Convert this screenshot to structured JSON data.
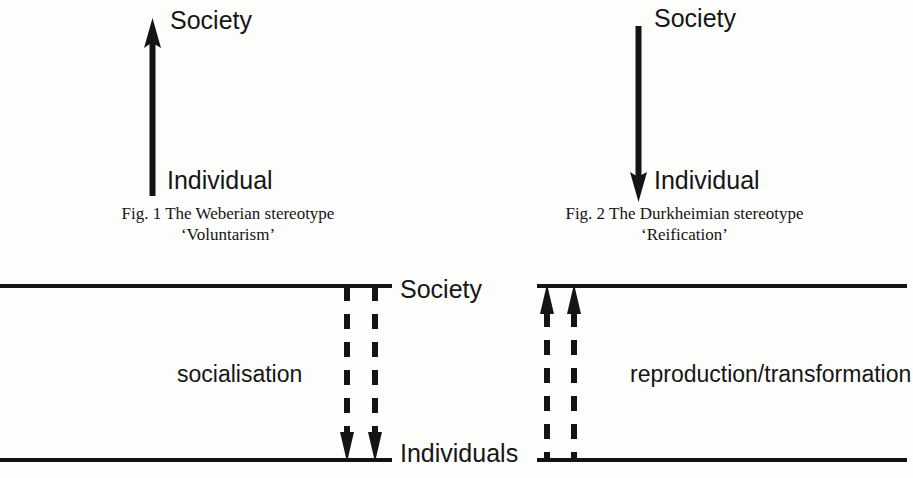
{
  "figures": [
    {
      "id": "fig1",
      "top_label": "Society",
      "bottom_label": "Individual",
      "arrow_direction": "up",
      "arrow_icon": "arrow-up-icon",
      "caption_line1": "Fig. 1 The Weberian stereotype",
      "caption_line2": "‘Voluntarism’"
    },
    {
      "id": "fig2",
      "top_label": "Society",
      "bottom_label": "Individual",
      "arrow_direction": "down",
      "arrow_icon": "arrow-down-icon",
      "caption_line1": "Fig. 2 The Durkheimian stereotype",
      "caption_line2": "‘Reification’"
    }
  ],
  "panels": [
    {
      "id": "panel-left",
      "process_label": "socialisation",
      "arrow_direction": "down",
      "arrow_icon": "dashed-arrow-down-icon",
      "arrow_count": 2,
      "top_line_label": "Society",
      "bottom_line_label": "Individuals"
    },
    {
      "id": "panel-right",
      "process_label": "reproduction/transformation",
      "arrow_direction": "up",
      "arrow_icon": "dashed-arrow-up-icon",
      "arrow_count": 2,
      "top_line_label": "Society",
      "bottom_line_label": "Individuals"
    }
  ],
  "shared_axis_labels": {
    "top": "Society",
    "bottom": "Individuals"
  },
  "colors": {
    "ink": "#141414",
    "page": "#fdfdfc"
  }
}
